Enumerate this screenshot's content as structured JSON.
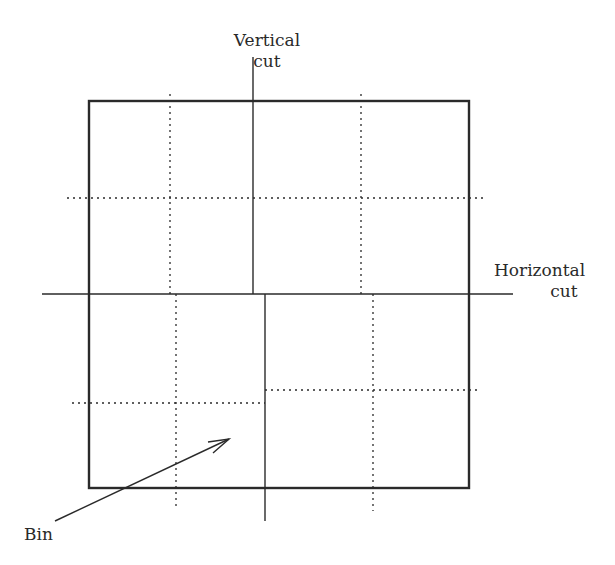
{
  "labels": {
    "vertical_cut": [
      "Vertical",
      "cut"
    ],
    "horizontal_cut": [
      "Horizontal",
      "cut"
    ],
    "bin": "Bin"
  },
  "colors": {
    "line": "#2a2a2a",
    "background": "#ffffff"
  },
  "geometry": {
    "box": {
      "x": 89,
      "y": 101,
      "width": 380,
      "height": 387
    },
    "horizontal_cut": {
      "x1": 42,
      "x2": 513,
      "y": 294
    },
    "vertical_cut_upper": {
      "x": 253,
      "y1": 57,
      "y2": 294
    },
    "vertical_cut_lower": {
      "x": 265,
      "y1": 294,
      "y2": 521
    },
    "arrow": {
      "x1": 55,
      "y1": 521,
      "x2": 229,
      "y2": 439
    }
  }
}
